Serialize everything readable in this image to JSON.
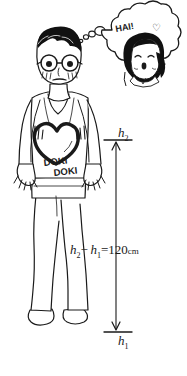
{
  "figure": {
    "background_color": "#ffffff",
    "ink_color": "#1a1a1a"
  },
  "character": {
    "description": "nervous man with glasses wearing a tank top",
    "hair_color": "#111111",
    "skin_color": "#ffffff",
    "shirt_text_line1": "DOKI",
    "shirt_text_line2": "DOKI",
    "heart_label": "pounding-heart"
  },
  "thought_bubble": {
    "exclamation": "HAI!",
    "heart_glyph": "♥",
    "subject": "smiling girl with bobbed hair making a peace sign",
    "small_bubbles": 3
  },
  "measurements": {
    "upper_mark_label_base": "h",
    "upper_mark_label_sub": "2",
    "lower_mark_label_base": "h",
    "lower_mark_label_sub": "1",
    "equation": {
      "term1_base": "h",
      "term1_sub": "2",
      "operator": "−",
      "term2_base": "h",
      "term2_sub": "1",
      "equals": "=",
      "value": "120",
      "unit": "cm"
    }
  }
}
